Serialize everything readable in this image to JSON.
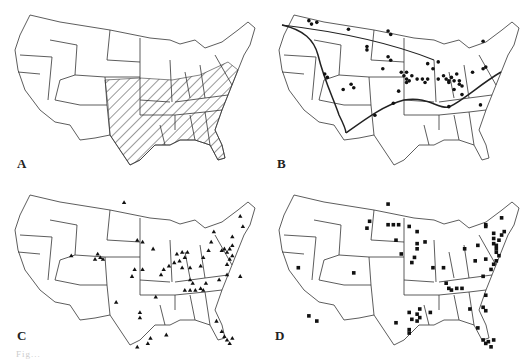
{
  "figure": {
    "panels": [
      {
        "label": "A",
        "content": "hatched-region",
        "description": "Shaded (hatched) region covering central and southeastern United States"
      },
      {
        "label": "B",
        "content": "circle-markers-with-boundary-line",
        "markers": [
          [
            0.17,
            0.12
          ],
          [
            0.18,
            0.14
          ],
          [
            0.2,
            0.13
          ],
          [
            0.32,
            0.17
          ],
          [
            0.47,
            0.18
          ],
          [
            0.48,
            0.2
          ],
          [
            0.39,
            0.27
          ],
          [
            0.39,
            0.29
          ],
          [
            0.47,
            0.33
          ],
          [
            0.48,
            0.35
          ],
          [
            0.45,
            0.4
          ],
          [
            0.52,
            0.42
          ],
          [
            0.54,
            0.42
          ],
          [
            0.53,
            0.44
          ],
          [
            0.54,
            0.46
          ],
          [
            0.56,
            0.44
          ],
          [
            0.55,
            0.47
          ],
          [
            0.54,
            0.48
          ],
          [
            0.58,
            0.46
          ],
          [
            0.6,
            0.46
          ],
          [
            0.62,
            0.46
          ],
          [
            0.61,
            0.48
          ],
          [
            0.62,
            0.37
          ],
          [
            0.64,
            0.4
          ],
          [
            0.66,
            0.36
          ],
          [
            0.66,
            0.46
          ],
          [
            0.68,
            0.44
          ],
          [
            0.69,
            0.46
          ],
          [
            0.7,
            0.47
          ],
          [
            0.7,
            0.48
          ],
          [
            0.71,
            0.45
          ],
          [
            0.72,
            0.47
          ],
          [
            0.73,
            0.43
          ],
          [
            0.74,
            0.47
          ],
          [
            0.75,
            0.5
          ],
          [
            0.74,
            0.49
          ],
          [
            0.72,
            0.52
          ],
          [
            0.75,
            0.55
          ],
          [
            0.79,
            0.42
          ],
          [
            0.83,
            0.4
          ],
          [
            0.84,
            0.39
          ],
          [
            0.83,
            0.24
          ],
          [
            0.23,
            0.43
          ],
          [
            0.24,
            0.45
          ],
          [
            0.3,
            0.52
          ],
          [
            0.33,
            0.49
          ],
          [
            0.34,
            0.51
          ],
          [
            0.51,
            0.53
          ],
          [
            0.49,
            0.6
          ],
          [
            0.42,
            0.67
          ],
          [
            0.7,
            0.62
          ],
          [
            0.82,
            0.61
          ]
        ]
      },
      {
        "label": "C",
        "content": "triangle-markers",
        "markers": [
          [
            0.47,
            0.13
          ],
          [
            0.27,
            0.44
          ],
          [
            0.37,
            0.43
          ],
          [
            0.38,
            0.45
          ],
          [
            0.36,
            0.46
          ],
          [
            0.39,
            0.46
          ],
          [
            0.52,
            0.35
          ],
          [
            0.54,
            0.36
          ],
          [
            0.58,
            0.4
          ],
          [
            0.51,
            0.52
          ],
          [
            0.54,
            0.52
          ],
          [
            0.5,
            0.56
          ],
          [
            0.62,
            0.52
          ],
          [
            0.61,
            0.55
          ],
          [
            0.64,
            0.5
          ],
          [
            0.66,
            0.48
          ],
          [
            0.67,
            0.43
          ],
          [
            0.69,
            0.42
          ],
          [
            0.71,
            0.42
          ],
          [
            0.7,
            0.45
          ],
          [
            0.68,
            0.47
          ],
          [
            0.69,
            0.51
          ],
          [
            0.72,
            0.51
          ],
          [
            0.72,
            0.58
          ],
          [
            0.73,
            0.6
          ],
          [
            0.7,
            0.64
          ],
          [
            0.72,
            0.64
          ],
          [
            0.74,
            0.64
          ],
          [
            0.76,
            0.63
          ],
          [
            0.77,
            0.64
          ],
          [
            0.78,
            0.6
          ],
          [
            0.76,
            0.5
          ],
          [
            0.77,
            0.45
          ],
          [
            0.79,
            0.41
          ],
          [
            0.8,
            0.36
          ],
          [
            0.81,
            0.3
          ],
          [
            0.84,
            0.41
          ],
          [
            0.85,
            0.4
          ],
          [
            0.86,
            0.42
          ],
          [
            0.87,
            0.4
          ],
          [
            0.88,
            0.38
          ],
          [
            0.88,
            0.44
          ],
          [
            0.87,
            0.46
          ],
          [
            0.86,
            0.49
          ],
          [
            0.88,
            0.33
          ],
          [
            0.91,
            0.21
          ],
          [
            0.92,
            0.27
          ],
          [
            0.86,
            0.55
          ],
          [
            0.83,
            0.58
          ],
          [
            0.91,
            0.56
          ],
          [
            0.59,
            0.68
          ],
          [
            0.44,
            0.71
          ],
          [
            0.53,
            0.77
          ],
          [
            0.53,
            0.8
          ],
          [
            0.57,
            0.92
          ],
          [
            0.56,
            0.95
          ],
          [
            0.52,
            0.97
          ],
          [
            0.63,
            0.9
          ],
          [
            0.82,
            0.82
          ],
          [
            0.84,
            0.88
          ],
          [
            0.85,
            0.91
          ],
          [
            0.86,
            0.93
          ],
          [
            0.87,
            0.95
          ],
          [
            0.88,
            0.92
          ]
        ]
      },
      {
        "label": "D",
        "content": "square-markers",
        "markers": [
          [
            0.47,
            0.14
          ],
          [
            0.4,
            0.24
          ],
          [
            0.39,
            0.28
          ],
          [
            0.47,
            0.26
          ],
          [
            0.49,
            0.26
          ],
          [
            0.51,
            0.26
          ],
          [
            0.55,
            0.27
          ],
          [
            0.5,
            0.35
          ],
          [
            0.58,
            0.3
          ],
          [
            0.61,
            0.36
          ],
          [
            0.58,
            0.37
          ],
          [
            0.58,
            0.4
          ],
          [
            0.57,
            0.45
          ],
          [
            0.52,
            0.43
          ],
          [
            0.56,
            0.48
          ],
          [
            0.64,
            0.51
          ],
          [
            0.68,
            0.51
          ],
          [
            0.76,
            0.4
          ],
          [
            0.81,
            0.38
          ],
          [
            0.84,
            0.26
          ],
          [
            0.84,
            0.27
          ],
          [
            0.87,
            0.31
          ],
          [
            0.87,
            0.34
          ],
          [
            0.87,
            0.37
          ],
          [
            0.88,
            0.38
          ],
          [
            0.88,
            0.4
          ],
          [
            0.88,
            0.42
          ],
          [
            0.89,
            0.35
          ],
          [
            0.9,
            0.32
          ],
          [
            0.89,
            0.44
          ],
          [
            0.88,
            0.47
          ],
          [
            0.87,
            0.49
          ],
          [
            0.86,
            0.52
          ],
          [
            0.84,
            0.46
          ],
          [
            0.8,
            0.47
          ],
          [
            0.83,
            0.56
          ],
          [
            0.9,
            0.22
          ],
          [
            0.91,
            0.3
          ],
          [
            0.69,
            0.6
          ],
          [
            0.7,
            0.63
          ],
          [
            0.71,
            0.64
          ],
          [
            0.73,
            0.63
          ],
          [
            0.75,
            0.63
          ],
          [
            0.84,
            0.67
          ],
          [
            0.83,
            0.74
          ],
          [
            0.84,
            0.76
          ],
          [
            0.78,
            0.75
          ],
          [
            0.63,
            0.77
          ],
          [
            0.58,
            0.78
          ],
          [
            0.59,
            0.8
          ],
          [
            0.58,
            0.82
          ],
          [
            0.56,
            0.81
          ],
          [
            0.55,
            0.77
          ],
          [
            0.59,
            0.75
          ],
          [
            0.5,
            0.83
          ],
          [
            0.55,
            0.87
          ],
          [
            0.55,
            0.89
          ],
          [
            0.81,
            0.86
          ],
          [
            0.83,
            0.93
          ],
          [
            0.84,
            0.95
          ],
          [
            0.85,
            0.94
          ],
          [
            0.86,
            0.97
          ],
          [
            0.87,
            0.93
          ],
          [
            0.34,
            0.54
          ],
          [
            0.17,
            0.79
          ],
          [
            0.2,
            0.82
          ],
          [
            0.13,
            0.51
          ]
        ]
      }
    ],
    "caption": "Fig..."
  }
}
